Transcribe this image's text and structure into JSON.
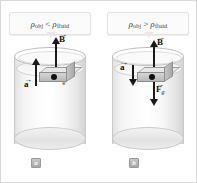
{
  "figure": {
    "border_color": "#d9d9d9",
    "background": "#ffffff"
  },
  "panels": [
    {
      "id": "a",
      "badge": "a",
      "callout": {
        "rho_symbol": "ρ",
        "obj_sub": "obj",
        "operator": "<",
        "fluid_sub": "fluid",
        "full_text": "ρobj < ρfluid"
      },
      "vectors": {
        "buoyant": {
          "label": "B",
          "direction": "up",
          "length_px": 30
        },
        "gravity": {
          "label": "F",
          "subscript": "g",
          "direction": "down",
          "length_px": 18
        },
        "acceleration": {
          "label": "a",
          "direction": "up",
          "length_px": 26
        }
      },
      "object": {
        "center_of_mass_marker": "dot",
        "shape": "rectangular-block"
      }
    },
    {
      "id": "b",
      "badge": "b",
      "callout": {
        "rho_symbol": "ρ",
        "obj_sub": "obj",
        "operator": ">",
        "fluid_sub": "fluid",
        "full_text": "ρobj > ρfluid"
      },
      "vectors": {
        "buoyant": {
          "label": "B",
          "direction": "up",
          "length_px": 26
        },
        "gravity": {
          "label": "F",
          "subscript": "g",
          "direction": "down",
          "length_px": 44
        },
        "acceleration": {
          "label": "a",
          "direction": "down",
          "length_px": 20
        }
      },
      "object": {
        "center_of_mass_marker": "dot",
        "shape": "rectangular-block"
      }
    }
  ],
  "colors": {
    "vector": "#1a1a1a",
    "cylinder_outline": "#c9c9c9",
    "block_fill": "#c4c4c4",
    "callout_bg": "#fbfbfb",
    "badge_bg": "#b4b4b4"
  }
}
